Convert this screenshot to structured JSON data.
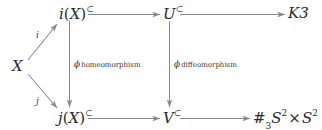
{
  "diagram": {
    "type": "commutative-diagram",
    "background_color": "#ffffff",
    "line_color": "#8a8a8a",
    "text_color": "#2b2b2b",
    "nodes": [
      {
        "id": "X",
        "label": "X",
        "x": 18,
        "y": 66
      },
      {
        "id": "iX",
        "label": "i(X)",
        "hook": "⊂",
        "x": 70,
        "y": 14
      },
      {
        "id": "jX",
        "label": "j(X)",
        "hook": "⊂",
        "x": 70,
        "y": 118
      },
      {
        "id": "U",
        "label": "U",
        "hook": "⊂",
        "x": 170,
        "y": 14
      },
      {
        "id": "V",
        "label": "V",
        "hook": "⊂",
        "x": 170,
        "y": 118
      },
      {
        "id": "K3",
        "label": "K3",
        "x": 296,
        "y": 14
      },
      {
        "id": "connsum",
        "label": "#3S2 × S2",
        "hash": "#",
        "hash_sub": "3",
        "sym1": "S",
        "sup1": "2",
        "times": "×",
        "sym2": "S",
        "sup2": "2",
        "x": 276,
        "y": 118
      }
    ],
    "edges": [
      {
        "id": "X-to-iX",
        "from": "X",
        "to": "iX",
        "label": "i",
        "style": "solid-arrow",
        "direction": "up-right"
      },
      {
        "id": "X-to-jX",
        "from": "X",
        "to": "jX",
        "label": "j",
        "style": "solid-arrow",
        "direction": "down-right"
      },
      {
        "id": "iX-to-U",
        "from": "iX",
        "to": "U",
        "label": "",
        "style": "hook-arrow",
        "direction": "right"
      },
      {
        "id": "U-to-K3",
        "from": "U",
        "to": "K3",
        "label": "",
        "style": "hook-arrow",
        "direction": "right"
      },
      {
        "id": "jX-to-V",
        "from": "jX",
        "to": "V",
        "label": "",
        "style": "hook-arrow",
        "direction": "right"
      },
      {
        "id": "V-to-sum",
        "from": "V",
        "to": "connsum",
        "label": "",
        "style": "hook-arrow",
        "direction": "right"
      },
      {
        "id": "iX-to-jX",
        "from": "iX",
        "to": "jX",
        "label": "homeomorphism",
        "label_symbol": "ϕ",
        "style": "solid-arrow",
        "direction": "down"
      },
      {
        "id": "U-to-V",
        "from": "U",
        "to": "V",
        "label": "diffeomorphism",
        "label_symbol": "ϕ",
        "style": "solid-arrow",
        "direction": "down"
      }
    ],
    "labels": {
      "i": "i",
      "j": "j",
      "phi": "ϕ",
      "homeomorphism": "homeomorphism",
      "diffeomorphism": "diffeomorphism",
      "K3": "K3",
      "X": "X",
      "U": "U",
      "V": "V",
      "i_of_X_fn": "i",
      "j_of_X_fn": "j",
      "open_paren": "(",
      "close_paren": ")",
      "X_arg": "X",
      "subset": "⊂",
      "hash": "#",
      "hash_index": "3",
      "S": "S",
      "exp_two": "2",
      "times": "×"
    }
  }
}
